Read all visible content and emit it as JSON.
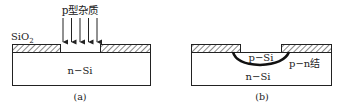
{
  "panel_a": {
    "dopant_label": "p型杂质",
    "oxide_label": "SiO",
    "oxide_subscript": "2",
    "substrate_label": "n−Si",
    "caption": "(a)",
    "arrow_count": 5
  },
  "panel_b": {
    "p_region_label": "p−Si",
    "junction_label": "p−n结",
    "substrate_label": "n−Si",
    "caption": "(b)"
  },
  "colors": {
    "line": "#222222",
    "background": "#ffffff"
  }
}
